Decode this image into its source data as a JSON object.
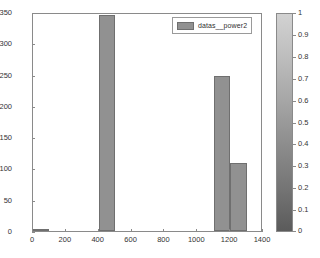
{
  "figure": {
    "background": "#ffffff",
    "axes_color": "#8a8a8a",
    "bar_fill": "#919191",
    "bar_edge": "#6f6f6f",
    "tick_text_color": "#333333"
  },
  "legend": {
    "label": "datas__power2",
    "swatch_color": "#919191"
  },
  "colorbar": {
    "ticks": [
      "1",
      "0.9",
      "0.8",
      "0.7",
      "0.6",
      "0.5",
      "0.4",
      "0.3",
      "0.2",
      "0.1",
      "0"
    ],
    "top_color": "#d2d2d2",
    "bottom_color": "#5b5b5b",
    "min": 0,
    "max": 1
  },
  "chart_data": {
    "type": "bar",
    "title": "",
    "xlabel": "",
    "ylabel": "",
    "xlim": [
      0,
      1400
    ],
    "ylim": [
      0,
      350
    ],
    "xticks": [
      0,
      200,
      400,
      600,
      800,
      1000,
      1200,
      1400
    ],
    "yticks": [
      0,
      50,
      100,
      150,
      200,
      250,
      300,
      350
    ],
    "grid": false,
    "legend_position": "top-right",
    "bar_style": "histogram",
    "bins": [
      {
        "x_start": 0,
        "x_end": 100,
        "value": 3
      },
      {
        "x_start": 400,
        "x_end": 500,
        "value": 345
      },
      {
        "x_start": 1100,
        "x_end": 1200,
        "value": 247
      },
      {
        "x_start": 1200,
        "x_end": 1300,
        "value": 108
      }
    ],
    "series": [
      {
        "name": "datas__power2",
        "categories": [
          "0-100",
          "400-500",
          "1100-1200",
          "1200-1300"
        ],
        "values": [
          3,
          345,
          247,
          108
        ]
      }
    ]
  }
}
